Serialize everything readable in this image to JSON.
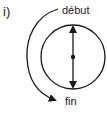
{
  "figure": {
    "part_label": "i)",
    "start_label": "début",
    "end_label": "fin",
    "stroke_color": "#1a1a1a",
    "background_color": "#ffffff"
  },
  "elements": {
    "circle": {
      "cx": 73,
      "cy": 57,
      "r": 32
    },
    "diameter": {
      "x": 73,
      "y_top": 25,
      "y_bottom": 89,
      "arrows": "both-outward"
    },
    "center_point": {
      "cx": 73,
      "cy": 57
    },
    "rotation_arrow": {
      "direction": "counterclockwise",
      "from": "début",
      "to": "fin"
    }
  }
}
